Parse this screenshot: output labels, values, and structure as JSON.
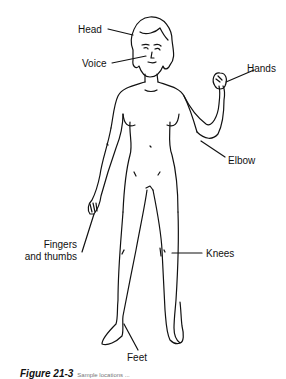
{
  "figure": {
    "labels": {
      "head": "Head",
      "voice": "Voice",
      "hands": "Hands",
      "elbow": "Elbow",
      "fingers_line1": "Fingers",
      "fingers_line2": "and thumbs",
      "knees": "Knees",
      "feet": "Feet"
    },
    "caption": {
      "prefix": "Figure 21-3",
      "text": "Sample locations ..."
    },
    "colors": {
      "line": "#111111",
      "background": "#ffffff"
    }
  }
}
